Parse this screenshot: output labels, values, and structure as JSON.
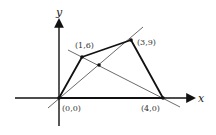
{
  "diagram": {
    "type": "quadrilateral-with-diagonals",
    "axes": {
      "x_label": "x",
      "y_label": "y"
    },
    "vertices": [
      {
        "label": "(0,0)",
        "name": "origin"
      },
      {
        "label": "(1,6)",
        "name": "vertex-b"
      },
      {
        "label": "(3,9)",
        "name": "vertex-c"
      },
      {
        "label": "(4,0)",
        "name": "vertex-d"
      }
    ],
    "colors": {
      "polygon": "#111111",
      "diagonals": "#444444",
      "axes": "#111111"
    }
  }
}
